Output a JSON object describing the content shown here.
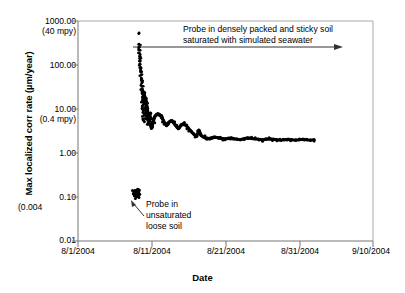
{
  "chart_data": {
    "type": "scatter",
    "title": "",
    "xlabel": "Date",
    "ylabel": "Max localized corr rate (µm/year)",
    "yscale": "log",
    "ylim": [
      0.01,
      1000.0
    ],
    "xlim": [
      "8/1/2004",
      "9/10/2004"
    ],
    "grid": false,
    "legend": null,
    "y_ticks": [
      {
        "value": 1000.0,
        "label": "1000.00",
        "sublabel": "(40 mpy)"
      },
      {
        "value": 100.0,
        "label": "100.00",
        "sublabel": ""
      },
      {
        "value": 10.0,
        "label": "10.00",
        "sublabel": "(0.4 mpy)"
      },
      {
        "value": 1.0,
        "label": "1.00",
        "sublabel": ""
      },
      {
        "value": 0.1,
        "label": "0.10",
        "sublabel": "(0.004"
      },
      {
        "value": 0.01,
        "label": "0.01",
        "sublabel": ""
      }
    ],
    "x_ticks": [
      {
        "value": 0,
        "label": "8/1/2004"
      },
      {
        "value": 10,
        "label": "8/11/2004"
      },
      {
        "value": 20,
        "label": "8/21/2004"
      },
      {
        "value": 30,
        "label": "8/31/2004"
      },
      {
        "value": 40,
        "label": "9/10/2004"
      }
    ],
    "annotations": [
      {
        "name": "upper-annotation",
        "line1": "Probe in densely packed and sticky soil",
        "line2": "saturated with simulated seawater",
        "arrow": "horizontal-right"
      },
      {
        "name": "lower-annotation",
        "line1": "Probe in",
        "line2": "unsaturated",
        "line3": "loose soil",
        "arrow": "diagonal-up-left"
      }
    ],
    "series": [
      {
        "name": "Max localized corrosion rate",
        "marker": "dot",
        "color": "#000000",
        "phase_unsaturated": {
          "x_days": [
            7.6,
            7.7,
            7.75,
            7.8,
            7.85,
            7.9,
            7.95,
            8.0,
            8.02,
            8.05,
            8.08,
            8.1,
            8.12,
            8.15,
            8.18,
            8.2
          ],
          "y": [
            0.125,
            0.115,
            0.13,
            0.108,
            0.122,
            0.118,
            0.135,
            0.112,
            0.126,
            0.119,
            0.131,
            0.114,
            0.128,
            0.121,
            0.117,
            0.124
          ]
        },
        "phase_spike": {
          "x_days": [
            8.25,
            8.27,
            8.3,
            8.32,
            8.35,
            8.37,
            8.4,
            8.42,
            8.45,
            8.47,
            8.5,
            8.52,
            8.55,
            8.57,
            8.6,
            8.62,
            8.65,
            8.67,
            8.7,
            8.72,
            8.75,
            8.77,
            8.8,
            8.82,
            8.85,
            8.87,
            8.9,
            8.92,
            8.95,
            8.97
          ],
          "y": [
            520,
            300,
            250,
            215,
            185,
            160,
            140,
            120,
            104,
            90,
            78,
            68,
            59,
            51,
            44,
            38,
            33,
            29,
            25,
            22,
            19,
            16.5,
            14.3,
            12.4,
            10.8,
            9.4,
            8.1,
            7.0,
            6.1,
            5.3
          ]
        },
        "phase_cluster": {
          "x_days": [
            9.0,
            9.05,
            9.1,
            9.15,
            9.2,
            9.25,
            9.3,
            9.35,
            9.4,
            9.45,
            9.5,
            9.55,
            9.6,
            9.65,
            9.7,
            9.75,
            9.8,
            9.85,
            9.9,
            9.95
          ],
          "y": [
            22,
            19,
            17,
            15,
            13,
            11.5,
            10,
            8.8,
            7.8,
            6.9,
            6.1,
            5.4,
            4.8,
            5.6,
            6.4,
            7.2,
            6.0,
            5.0,
            4.2,
            3.6
          ]
        },
        "phase_decay": {
          "x_days": [
            10.0,
            10.2,
            10.4,
            10.6,
            10.8,
            11.0,
            11.2,
            11.4,
            11.6,
            11.8,
            12.0,
            12.2,
            12.4,
            12.6,
            12.8,
            13.0,
            13.2,
            13.4,
            13.6,
            13.8,
            14.0,
            14.3,
            14.6,
            14.9,
            15.2,
            15.5,
            15.8,
            16.1,
            16.4,
            16.7,
            17.0,
            17.3,
            17.6,
            17.9,
            18.2,
            18.5,
            18.8,
            19.1,
            19.4,
            19.7,
            20.0,
            20.4,
            20.8,
            21.2,
            21.6,
            22.0,
            22.5,
            23.0,
            23.5,
            24.0,
            24.5,
            25.0,
            25.5,
            26.0,
            26.5,
            27.0,
            27.5,
            28.0,
            28.5,
            29.0,
            29.5,
            30.0,
            30.5,
            31.0,
            31.5,
            32.0
          ],
          "y": [
            4.0,
            5.2,
            6.6,
            7.4,
            7.8,
            7.6,
            7.0,
            6.2,
            5.4,
            4.7,
            4.2,
            4.5,
            5.1,
            5.4,
            5.2,
            4.8,
            4.3,
            3.9,
            3.6,
            3.9,
            4.4,
            4.6,
            4.3,
            3.8,
            3.3,
            2.9,
            2.6,
            2.4,
            3.3,
            2.5,
            2.3,
            2.2,
            2.15,
            2.1,
            2.2,
            2.3,
            2.25,
            2.2,
            2.15,
            2.1,
            2.1,
            2.15,
            2.2,
            2.1,
            2.05,
            2.0,
            2.1,
            2.2,
            2.15,
            2.1,
            2.05,
            2.0,
            2.05,
            2.1,
            2.05,
            2.0,
            1.95,
            2.0,
            2.05,
            2.0,
            1.95,
            2.0,
            2.05,
            2.0,
            1.95,
            2.0
          ]
        }
      }
    ]
  }
}
